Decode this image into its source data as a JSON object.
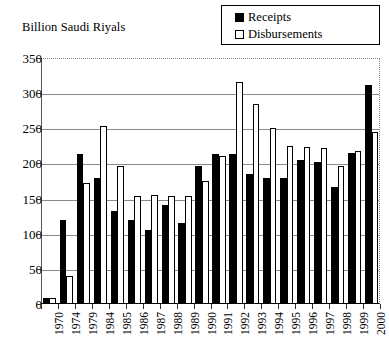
{
  "chart_data": {
    "type": "bar",
    "title": "",
    "ylabel": "Billion Saudi Riyals",
    "xlabel": "",
    "ylim": [
      0,
      350
    ],
    "ytick_step": 50,
    "yticks": [
      0,
      50,
      100,
      150,
      200,
      250,
      300,
      350
    ],
    "grid": true,
    "legend_position": "top-right",
    "categories": [
      "1970",
      "1974",
      "1979",
      "1984",
      "1985",
      "1986",
      "1987",
      "1988",
      "1989",
      "1990",
      "1991",
      "1992",
      "1993",
      "1994",
      "1995",
      "1996",
      "1997",
      "1998",
      "1999",
      "2000"
    ],
    "series": [
      {
        "name": "Receipts",
        "color": "#000000",
        "values": [
          8,
          120,
          214,
          180,
          132,
          119,
          105,
          141,
          115,
          197,
          213,
          214,
          185,
          179,
          179,
          205,
          202,
          167,
          215,
          312
        ]
      },
      {
        "name": "Disbursements",
        "color": "#ffffff",
        "values": [
          8,
          40,
          172,
          253,
          197,
          153,
          155,
          153,
          153,
          175,
          211,
          316,
          285,
          250,
          225,
          223,
          222,
          197,
          217,
          245
        ]
      }
    ]
  },
  "legend": {
    "items": [
      {
        "label": "Receipts",
        "swatch": "filled-square-icon"
      },
      {
        "label": "Disbursements",
        "swatch": "hollow-square-icon"
      }
    ]
  },
  "axis": {
    "y_title": "Billion Saudi Riyals",
    "y_labels": [
      "350",
      "300",
      "250",
      "200",
      "150",
      "100",
      "50",
      "0"
    ],
    "x_labels": [
      "1970",
      "1974",
      "1979",
      "1984",
      "1985",
      "1986",
      "1987",
      "1988",
      "1989",
      "1990",
      "1991",
      "1992",
      "1993",
      "1994",
      "1995",
      "1996",
      "1997",
      "1998",
      "1999",
      "2000"
    ]
  },
  "colors": {
    "receipts": "#000000",
    "disbursements": "#ffffff",
    "axis": "#000000",
    "grid": "#8a8a8a",
    "background": "#ffffff"
  }
}
